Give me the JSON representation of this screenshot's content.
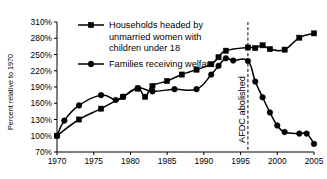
{
  "chart_data": {
    "type": "line",
    "title": "",
    "xlabel": "",
    "ylabel": "Percent relative to 1970",
    "xlim": [
      1970,
      2005
    ],
    "ylim": [
      70,
      310
    ],
    "ytick_values": [
      70,
      100,
      130,
      160,
      190,
      220,
      250,
      280,
      310
    ],
    "ytick_labels": [
      "70%",
      "100%",
      "130%",
      "160%",
      "190%",
      "220%",
      "250%",
      "280%",
      "310%"
    ],
    "xtick_values": [
      1970,
      1975,
      1980,
      1985,
      1990,
      1995,
      2000,
      2005
    ],
    "xtick_labels": [
      "1970",
      "1975",
      "1980",
      "1985",
      "1990",
      "1995",
      "2000",
      "2005"
    ],
    "grid": false,
    "legend_position": "top-left",
    "series": [
      {
        "name": "Households headed by unmarried women with children under 18",
        "marker": "square",
        "points": [
          [
            1970,
            100
          ],
          [
            1973,
            130
          ],
          [
            1976,
            150
          ],
          [
            1979,
            172
          ],
          [
            1981,
            187
          ],
          [
            1982,
            172
          ],
          [
            1983,
            192
          ],
          [
            1985,
            201
          ],
          [
            1987,
            213
          ],
          [
            1989,
            222
          ],
          [
            1991,
            232
          ],
          [
            1992,
            245
          ],
          [
            1993,
            257
          ],
          [
            1996,
            263
          ],
          [
            1997,
            262
          ],
          [
            1998,
            267
          ],
          [
            1999,
            260
          ],
          [
            2001,
            259
          ],
          [
            2003,
            281
          ],
          [
            2005,
            289
          ]
        ]
      },
      {
        "name": "Families receiving welfare",
        "marker": "circle",
        "points": [
          [
            1970,
            100
          ],
          [
            1971,
            128
          ],
          [
            1973,
            156
          ],
          [
            1976,
            175
          ],
          [
            1978,
            166
          ],
          [
            1979,
            172
          ],
          [
            1981,
            188
          ],
          [
            1983,
            182
          ],
          [
            1986,
            186
          ],
          [
            1989,
            186
          ],
          [
            1991,
            213
          ],
          [
            1992,
            229
          ],
          [
            1993,
            243
          ],
          [
            1994,
            239
          ],
          [
            1996,
            238
          ],
          [
            1997,
            200
          ],
          [
            1998,
            171
          ],
          [
            1999,
            143
          ],
          [
            2000,
            119
          ],
          [
            2001,
            107
          ],
          [
            2003,
            104
          ],
          [
            2004,
            104
          ],
          [
            2005,
            85
          ]
        ]
      }
    ],
    "annotations": [
      {
        "text": "AFDC abolished",
        "x": 1996,
        "orientation": "vertical",
        "line": "dashed"
      }
    ],
    "legend_entries": [
      {
        "marker": "square",
        "lines": [
          "Households headed by",
          "unmarried women with",
          "children under 18"
        ]
      },
      {
        "marker": "circle",
        "lines": [
          "Families receiving welfare"
        ]
      }
    ]
  },
  "colors": {
    "ink": "#000000",
    "background": "#ffffff"
  }
}
